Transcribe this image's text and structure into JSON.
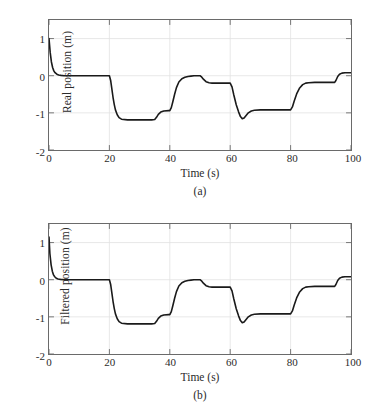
{
  "figure": {
    "background_color": "#ffffff",
    "axis_color": "#6a6a6a",
    "grid_color": "#e2e2e2",
    "line_color": "#1a1a1a"
  },
  "panels": [
    {
      "id": "a",
      "caption": "(a)",
      "ylabel": "Real position (m)",
      "xlabel": "Time (s)"
    },
    {
      "id": "b",
      "caption": "(b)",
      "ylabel": "Filtered position (m)",
      "xlabel": "Time (s)"
    }
  ],
  "chart_data": [
    {
      "type": "line",
      "title": "",
      "subtitle": "(a)",
      "xlabel": "Time (s)",
      "ylabel": "Real position (m)",
      "xlim": [
        0,
        100
      ],
      "ylim": [
        -2,
        1.5
      ],
      "xticks": [
        0,
        20,
        40,
        60,
        80,
        100
      ],
      "yticks": [
        1,
        0,
        -1,
        -2
      ],
      "xticklabels": [
        "0",
        "20",
        "40",
        "60",
        "80",
        "100"
      ],
      "yticklabels": [
        "1",
        "0",
        "-1",
        "-2"
      ],
      "grid": true,
      "legend": null,
      "series": [
        {
          "name": "Real position",
          "x": [
            0,
            0.4,
            0.8,
            1.2,
            1.6,
            2.0,
            2.6,
            3.2,
            4.0,
            5.0,
            8.0,
            12.0,
            16.0,
            19.6,
            20.0,
            20.4,
            20.8,
            21.2,
            21.6,
            22.0,
            22.6,
            23.2,
            24.0,
            26.0,
            30.0,
            34.0,
            35.0,
            35.6,
            36.2,
            37.0,
            38.0,
            39.6,
            40.0,
            40.5,
            41.0,
            41.6,
            42.2,
            43.0,
            44.0,
            45.0,
            46.0,
            47.0,
            48.0,
            49.0,
            49.6,
            50.0,
            50.6,
            51.2,
            52.0,
            53.0,
            54.0,
            56.0,
            58.0,
            59.6,
            60.0,
            60.6,
            61.2,
            62.0,
            62.8,
            63.4,
            64.0,
            64.6,
            65.2,
            66.0,
            67.0,
            68.0,
            70.0,
            74.0,
            78.0,
            79.6,
            80.0,
            80.6,
            81.2,
            82.0,
            83.0,
            84.0,
            85.0,
            86.0,
            88.0,
            92.0,
            94.6,
            95.0,
            95.6,
            96.2,
            97.0,
            98.0,
            100.0
          ],
          "y": [
            1.0,
            0.62,
            0.37,
            0.22,
            0.13,
            0.08,
            0.04,
            0.02,
            0.01,
            0.0,
            0.0,
            0.0,
            0.0,
            0.0,
            0.0,
            -0.12,
            -0.35,
            -0.58,
            -0.77,
            -0.92,
            -1.05,
            -1.13,
            -1.17,
            -1.19,
            -1.19,
            -1.19,
            -1.18,
            -1.12,
            -1.04,
            -0.98,
            -0.95,
            -0.94,
            -0.94,
            -0.86,
            -0.7,
            -0.5,
            -0.32,
            -0.17,
            -0.08,
            -0.04,
            -0.02,
            -0.01,
            0.0,
            0.0,
            0.0,
            0.0,
            -0.04,
            -0.1,
            -0.16,
            -0.19,
            -0.2,
            -0.2,
            -0.2,
            -0.2,
            -0.2,
            -0.3,
            -0.52,
            -0.78,
            -0.98,
            -1.1,
            -1.16,
            -1.14,
            -1.08,
            -1.0,
            -0.95,
            -0.93,
            -0.92,
            -0.92,
            -0.92,
            -0.92,
            -0.92,
            -0.84,
            -0.68,
            -0.49,
            -0.33,
            -0.24,
            -0.2,
            -0.19,
            -0.18,
            -0.18,
            -0.18,
            -0.13,
            -0.02,
            0.04,
            0.07,
            0.08,
            0.08
          ]
        }
      ]
    },
    {
      "type": "line",
      "title": "",
      "subtitle": "(b)",
      "xlabel": "Time (s)",
      "ylabel": "Filtered position (m)",
      "xlim": [
        0,
        100
      ],
      "ylim": [
        -2,
        1.5
      ],
      "xticks": [
        0,
        20,
        40,
        60,
        80,
        100
      ],
      "yticks": [
        1,
        0,
        -1,
        -2
      ],
      "xticklabels": [
        "0",
        "20",
        "40",
        "60",
        "80",
        "100"
      ],
      "yticklabels": [
        "1",
        "0",
        "-1",
        "-2"
      ],
      "grid": true,
      "legend": null,
      "series": [
        {
          "name": "Filtered position",
          "x": [
            0,
            0.3,
            0.7,
            1.1,
            1.5,
            1.9,
            2.4,
            3.0,
            3.8,
            5.0,
            8.0,
            12.0,
            16.0,
            19.6,
            20.0,
            20.4,
            20.8,
            21.2,
            21.6,
            22.0,
            22.6,
            23.2,
            24.0,
            26.0,
            30.0,
            34.0,
            35.0,
            35.6,
            36.2,
            37.0,
            38.0,
            39.6,
            40.0,
            40.5,
            41.0,
            41.6,
            42.2,
            43.0,
            44.0,
            45.0,
            46.0,
            47.0,
            48.0,
            49.0,
            49.6,
            50.0,
            50.6,
            51.2,
            52.0,
            53.0,
            54.0,
            56.0,
            58.0,
            59.6,
            60.0,
            60.6,
            61.2,
            62.0,
            62.8,
            63.4,
            64.0,
            64.6,
            65.2,
            66.0,
            67.0,
            68.0,
            70.0,
            74.0,
            78.0,
            79.6,
            80.0,
            80.6,
            81.2,
            82.0,
            83.0,
            84.0,
            85.0,
            86.0,
            88.0,
            92.0,
            94.6,
            95.0,
            95.6,
            96.2,
            97.0,
            98.0,
            100.0
          ],
          "y": [
            1.15,
            0.7,
            0.4,
            0.23,
            0.13,
            0.08,
            0.04,
            0.02,
            0.01,
            0.0,
            0.0,
            0.0,
            0.0,
            0.0,
            0.0,
            -0.12,
            -0.35,
            -0.58,
            -0.77,
            -0.92,
            -1.05,
            -1.13,
            -1.17,
            -1.19,
            -1.19,
            -1.19,
            -1.18,
            -1.12,
            -1.04,
            -0.98,
            -0.95,
            -0.94,
            -0.94,
            -0.86,
            -0.7,
            -0.5,
            -0.32,
            -0.17,
            -0.08,
            -0.04,
            -0.02,
            -0.01,
            0.0,
            0.0,
            0.0,
            0.0,
            -0.04,
            -0.1,
            -0.16,
            -0.19,
            -0.2,
            -0.2,
            -0.2,
            -0.2,
            -0.2,
            -0.3,
            -0.52,
            -0.78,
            -0.98,
            -1.1,
            -1.16,
            -1.14,
            -1.08,
            -1.0,
            -0.95,
            -0.93,
            -0.92,
            -0.92,
            -0.92,
            -0.92,
            -0.92,
            -0.84,
            -0.68,
            -0.49,
            -0.33,
            -0.24,
            -0.2,
            -0.19,
            -0.18,
            -0.18,
            -0.18,
            -0.13,
            -0.02,
            0.04,
            0.07,
            0.08,
            0.08
          ]
        }
      ]
    }
  ]
}
